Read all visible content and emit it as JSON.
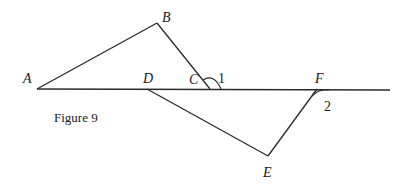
{
  "figure": {
    "caption": "Figure 9",
    "points": {
      "A": {
        "label": "A",
        "x": 37,
        "y": 89
      },
      "B": {
        "label": "B",
        "x": 157,
        "y": 23
      },
      "C": {
        "label": "C",
        "x": 210,
        "y": 89
      },
      "D": {
        "label": "D",
        "x": 147,
        "y": 89
      },
      "E": {
        "label": "E",
        "x": 268,
        "y": 156
      },
      "F": {
        "label": "F",
        "x": 317,
        "y": 89
      }
    },
    "line_end": {
      "x": 390,
      "y": 90
    },
    "angles": [
      {
        "label": "1",
        "vertex": "C"
      },
      {
        "label": "2",
        "vertex": "F"
      }
    ],
    "segments": [
      "A-line_end",
      "A-B",
      "B-C",
      "D-E",
      "E-F"
    ]
  }
}
